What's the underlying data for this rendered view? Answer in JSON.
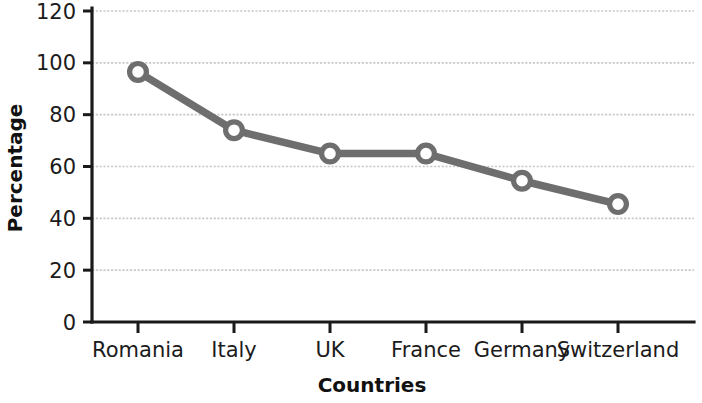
{
  "chart_data": {
    "type": "line",
    "title": "",
    "subtitle": "",
    "xlabel": "Countries",
    "ylabel": "Percentage",
    "categories": [
      "Romania",
      "Italy",
      "UK",
      "France",
      "Germany",
      "Switzerland"
    ],
    "values": [
      96.5,
      74,
      65,
      65,
      54.5,
      45.5
    ],
    "series": [
      {
        "name": "Percentage",
        "values": [
          96.5,
          74,
          65,
          65,
          54.5,
          45.5
        ]
      }
    ],
    "ylim": [
      0,
      120
    ],
    "ytick_step": 20,
    "yticks": [
      "0",
      "20",
      "40",
      "60",
      "80",
      "100",
      "120"
    ],
    "ytick_values": [
      0,
      20,
      40,
      60,
      80,
      100,
      120
    ],
    "grid": true,
    "grid_axis": "y",
    "legend": false,
    "legend_position": "none",
    "marker": "open-circle",
    "colors": {
      "line": "#6e6e6e",
      "marker_fill": "#ffffff",
      "marker_stroke": "#6e6e6e",
      "gridline": "#c9c9c9",
      "axis": "#1a1a1a",
      "text": "#1b1b1b",
      "background": "#ffffff"
    }
  }
}
